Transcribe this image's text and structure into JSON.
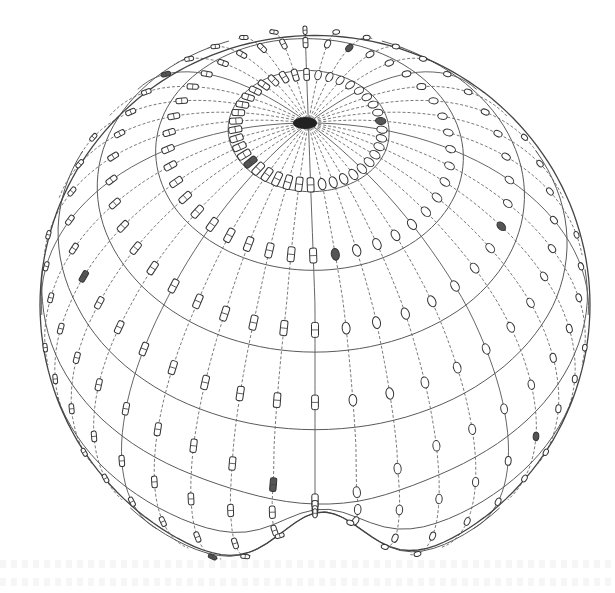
{
  "figure": {
    "type": "wireframe-sphere-vector-field",
    "colors": {
      "background": "#ffffff",
      "lines": "#5a5a5a",
      "glyph_stroke": "#333333",
      "pole": "#222222"
    },
    "geometry": {
      "center_x": 315,
      "center_y": 305,
      "radius": 275,
      "pole_x": 305,
      "pole_y": 123,
      "bottom_cusp_x": 323,
      "bottom_cusp_y": 505,
      "meridian_count": 40,
      "latitude_count": 9
    },
    "glyph_styles": {
      "left_hemisphere": "rectangle-hourglass",
      "right_hemisphere": "ellipse"
    }
  }
}
